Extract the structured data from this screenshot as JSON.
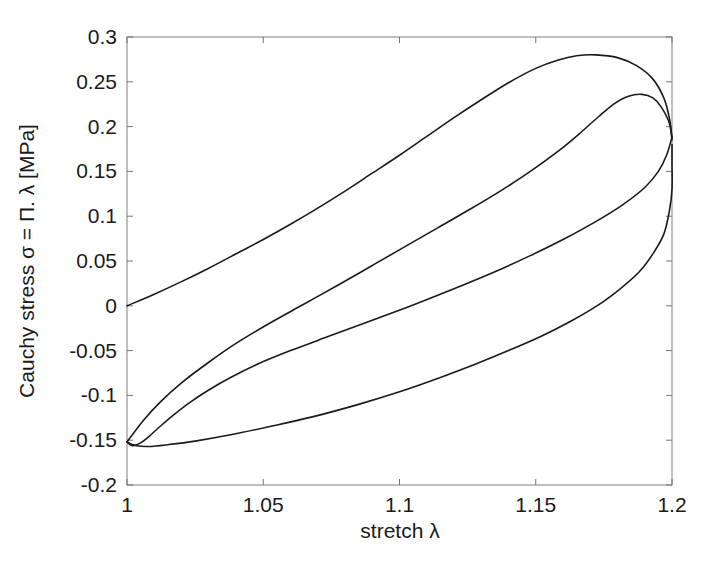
{
  "chart_data": {
    "type": "line",
    "title": "",
    "xlabel": "stretch λ",
    "ylabel": "Cauchy stress σ = Π. λ [MPa]",
    "xlim": [
      1,
      1.2
    ],
    "ylim": [
      -0.2,
      0.3
    ],
    "xticks": [
      1,
      1.05,
      1.1,
      1.15,
      1.2
    ],
    "xticklabels": [
      "1",
      "1.05",
      "1.1",
      "1.15",
      "1.2"
    ],
    "yticks": [
      -0.2,
      -0.15,
      -0.1,
      -0.05,
      0,
      0.05,
      0.1,
      0.15,
      0.2,
      0.25,
      0.3
    ],
    "yticklabels": [
      "-0.2",
      "-0.15",
      "-0.1",
      "-0.05",
      "0",
      "0.05",
      "0.1",
      "0.15",
      "0.2",
      "0.25",
      "0.3"
    ],
    "grid": false,
    "legend": "none",
    "line_color": "#1a1a1a",
    "line_width": 1.6,
    "series": [
      {
        "name": "first-loading-branch",
        "comment": "initial virgin loading from origin up to peak",
        "points": [
          [
            1.0,
            0.0
          ],
          [
            1.01,
            0.013
          ],
          [
            1.02,
            0.027
          ],
          [
            1.03,
            0.042
          ],
          [
            1.04,
            0.058
          ],
          [
            1.05,
            0.074
          ],
          [
            1.06,
            0.091
          ],
          [
            1.07,
            0.109
          ],
          [
            1.08,
            0.128
          ],
          [
            1.09,
            0.148
          ],
          [
            1.1,
            0.168
          ],
          [
            1.11,
            0.189
          ],
          [
            1.12,
            0.21
          ],
          [
            1.13,
            0.23
          ],
          [
            1.14,
            0.249
          ],
          [
            1.15,
            0.265
          ],
          [
            1.158,
            0.274
          ],
          [
            1.165,
            0.279
          ],
          [
            1.172,
            0.28
          ],
          [
            1.18,
            0.277
          ],
          [
            1.187,
            0.268
          ],
          [
            1.193,
            0.253
          ],
          [
            1.197,
            0.232
          ],
          [
            1.199,
            0.21
          ],
          [
            1.2,
            0.188
          ]
        ]
      },
      {
        "name": "unloading-branch",
        "comment": "unloading from peak stretch back to minimum stress near lambda = 1.005",
        "points": [
          [
            1.2,
            0.188
          ],
          [
            1.198,
            0.168
          ],
          [
            1.195,
            0.15
          ],
          [
            1.19,
            0.132
          ],
          [
            1.182,
            0.113
          ],
          [
            1.172,
            0.094
          ],
          [
            1.16,
            0.074
          ],
          [
            1.148,
            0.056
          ],
          [
            1.135,
            0.038
          ],
          [
            1.12,
            0.019
          ],
          [
            1.105,
            0.001
          ],
          [
            1.09,
            -0.016
          ],
          [
            1.075,
            -0.033
          ],
          [
            1.06,
            -0.05
          ],
          [
            1.048,
            -0.065
          ],
          [
            1.038,
            -0.08
          ],
          [
            1.03,
            -0.094
          ],
          [
            1.023,
            -0.108
          ],
          [
            1.017,
            -0.122
          ],
          [
            1.012,
            -0.135
          ],
          [
            1.008,
            -0.146
          ],
          [
            1.005,
            -0.153
          ],
          [
            1.002,
            -0.156
          ],
          [
            1.0,
            -0.152
          ]
        ]
      },
      {
        "name": "second-loading-branch",
        "comment": "reloading from minimum up to the lower peak, closing the hysteresis loop",
        "points": [
          [
            1.0,
            -0.152
          ],
          [
            1.003,
            -0.156
          ],
          [
            1.008,
            -0.157
          ],
          [
            1.015,
            -0.155
          ],
          [
            1.025,
            -0.151
          ],
          [
            1.038,
            -0.144
          ],
          [
            1.052,
            -0.135
          ],
          [
            1.068,
            -0.124
          ],
          [
            1.085,
            -0.11
          ],
          [
            1.1,
            -0.096
          ],
          [
            1.115,
            -0.08
          ],
          [
            1.128,
            -0.065
          ],
          [
            1.14,
            -0.05
          ],
          [
            1.152,
            -0.034
          ],
          [
            1.163,
            -0.017
          ],
          [
            1.173,
            0.001
          ],
          [
            1.181,
            0.019
          ],
          [
            1.188,
            0.038
          ],
          [
            1.193,
            0.058
          ],
          [
            1.197,
            0.08
          ],
          [
            1.199,
            0.105
          ],
          [
            1.2,
            0.13
          ],
          [
            1.2,
            0.16
          ],
          [
            1.2,
            0.18
          ]
        ]
      },
      {
        "name": "lower-loading-branch",
        "comment": "softened reloading path rising to the lower peak around 0.236 MPa",
        "points": [
          [
            1.0,
            -0.152
          ],
          [
            1.006,
            -0.128
          ],
          [
            1.012,
            -0.108
          ],
          [
            1.02,
            -0.086
          ],
          [
            1.03,
            -0.063
          ],
          [
            1.04,
            -0.042
          ],
          [
            1.052,
            -0.02
          ],
          [
            1.065,
            0.002
          ],
          [
            1.078,
            0.024
          ],
          [
            1.09,
            0.045
          ],
          [
            1.102,
            0.066
          ],
          [
            1.114,
            0.087
          ],
          [
            1.126,
            0.108
          ],
          [
            1.138,
            0.13
          ],
          [
            1.148,
            0.15
          ],
          [
            1.158,
            0.172
          ],
          [
            1.166,
            0.192
          ],
          [
            1.173,
            0.211
          ],
          [
            1.179,
            0.226
          ],
          [
            1.184,
            0.234
          ],
          [
            1.189,
            0.236
          ],
          [
            1.193,
            0.232
          ],
          [
            1.196,
            0.222
          ],
          [
            1.199,
            0.204
          ],
          [
            1.2,
            0.185
          ]
        ]
      }
    ]
  },
  "axes": {
    "box_color": "#888888",
    "tick_color": "#666666"
  }
}
